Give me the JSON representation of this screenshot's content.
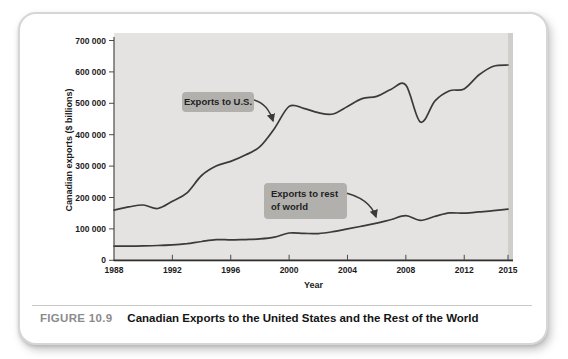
{
  "figure": {
    "label": "FIGURE 10.9",
    "title": "Canadian Exports to the United States and the Rest of the World"
  },
  "chart_data": {
    "type": "line",
    "xlabel": "Year",
    "ylabel": "Canadian exports ($ billions)",
    "xlim": [
      1988,
      2015
    ],
    "ylim": [
      0,
      700000
    ],
    "grid": false,
    "legend_position": "none",
    "plot_bg": "#e4e3e1",
    "line_color": "#3a3a3a",
    "x_ticks": [
      {
        "label": "1988",
        "value": 1988
      },
      {
        "label": "1992",
        "value": 1992
      },
      {
        "label": "1996",
        "value": 1996
      },
      {
        "label": "2000",
        "value": 2000
      },
      {
        "label": "2004",
        "value": 2004
      },
      {
        "label": "2008",
        "value": 2008
      },
      {
        "label": "2012",
        "value": 2012
      },
      {
        "label": "2015",
        "value": 2015
      }
    ],
    "y_ticks": [
      {
        "label": "0",
        "value": 0
      },
      {
        "label": "100 000",
        "value": 100000
      },
      {
        "label": "200 000",
        "value": 200000
      },
      {
        "label": "300 000",
        "value": 300000
      },
      {
        "label": "400 000",
        "value": 400000
      },
      {
        "label": "500 000",
        "value": 500000
      },
      {
        "label": "600 000",
        "value": 600000
      },
      {
        "label": "700 000",
        "value": 700000
      }
    ],
    "x": [
      1988,
      1989,
      1990,
      1991,
      1992,
      1993,
      1994,
      1995,
      1996,
      1997,
      1998,
      1999,
      2000,
      2001,
      2002,
      2003,
      2004,
      2005,
      2006,
      2007,
      2008,
      2009,
      2010,
      2011,
      2012,
      2013,
      2014,
      2015
    ],
    "series": [
      {
        "name": "Exports to U.S.",
        "values": [
          160000,
          170000,
          176000,
          165000,
          188000,
          215000,
          270000,
          300000,
          315000,
          335000,
          362000,
          420000,
          490000,
          484000,
          470000,
          466000,
          490000,
          515000,
          522000,
          545000,
          558000,
          440000,
          508000,
          540000,
          546000,
          590000,
          618000,
          622000
        ]
      },
      {
        "name": "Exports to rest of world",
        "values": [
          45000,
          45000,
          46000,
          47000,
          49000,
          53000,
          60000,
          66000,
          65000,
          66000,
          68000,
          74000,
          87000,
          86000,
          85000,
          91000,
          100000,
          109000,
          118000,
          130000,
          142000,
          127000,
          140000,
          151000,
          150000,
          154000,
          158000,
          163000
        ]
      }
    ],
    "annotations": [
      {
        "text": "Exports to U.S."
      },
      {
        "text": "Exports to rest of world",
        "lines": [
          "Exports to rest",
          "of world"
        ]
      }
    ]
  }
}
